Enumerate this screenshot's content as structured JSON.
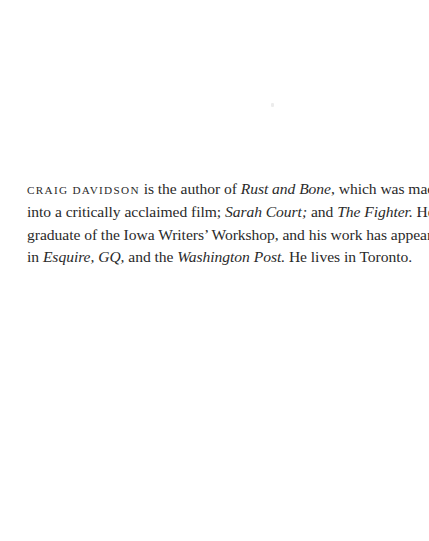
{
  "bio": {
    "author_name": "Craig Davidson",
    "segments": {
      "s1": " is the author of ",
      "book1": "Rust and Bone",
      "s2": ", which was made into a critically acclaimed film; ",
      "book2": "Sarah Court;",
      "s3": " and ",
      "book3": "The Fighter.",
      "s4": " He is a graduate of the Iowa Writers’ Workshop, and his work has appeared in ",
      "pub1": "Esquire, GQ,",
      "s5": " and the ",
      "pub2": "Washington Post.",
      "s6": " He lives in Toronto."
    },
    "lines": [
      {
        "name": "CRAIG DAVIDSON",
        "a": " is the author of ",
        "i1": "Rust and Bone",
        "b": ", which was made"
      },
      {
        "a": "into a critically acclaimed film; ",
        "i1": "Sarah Court;",
        "b": " and ",
        "i2": "The Fighter.",
        "c": " He is a"
      },
      {
        "a": "graduate of the Iowa Writers’ Workshop, and his work has appeared"
      },
      {
        "a": "in ",
        "i1": "Esquire, GQ,",
        "b": " and the ",
        "i2": "Washington Post.",
        "c": " He lives in Toronto."
      }
    ]
  }
}
